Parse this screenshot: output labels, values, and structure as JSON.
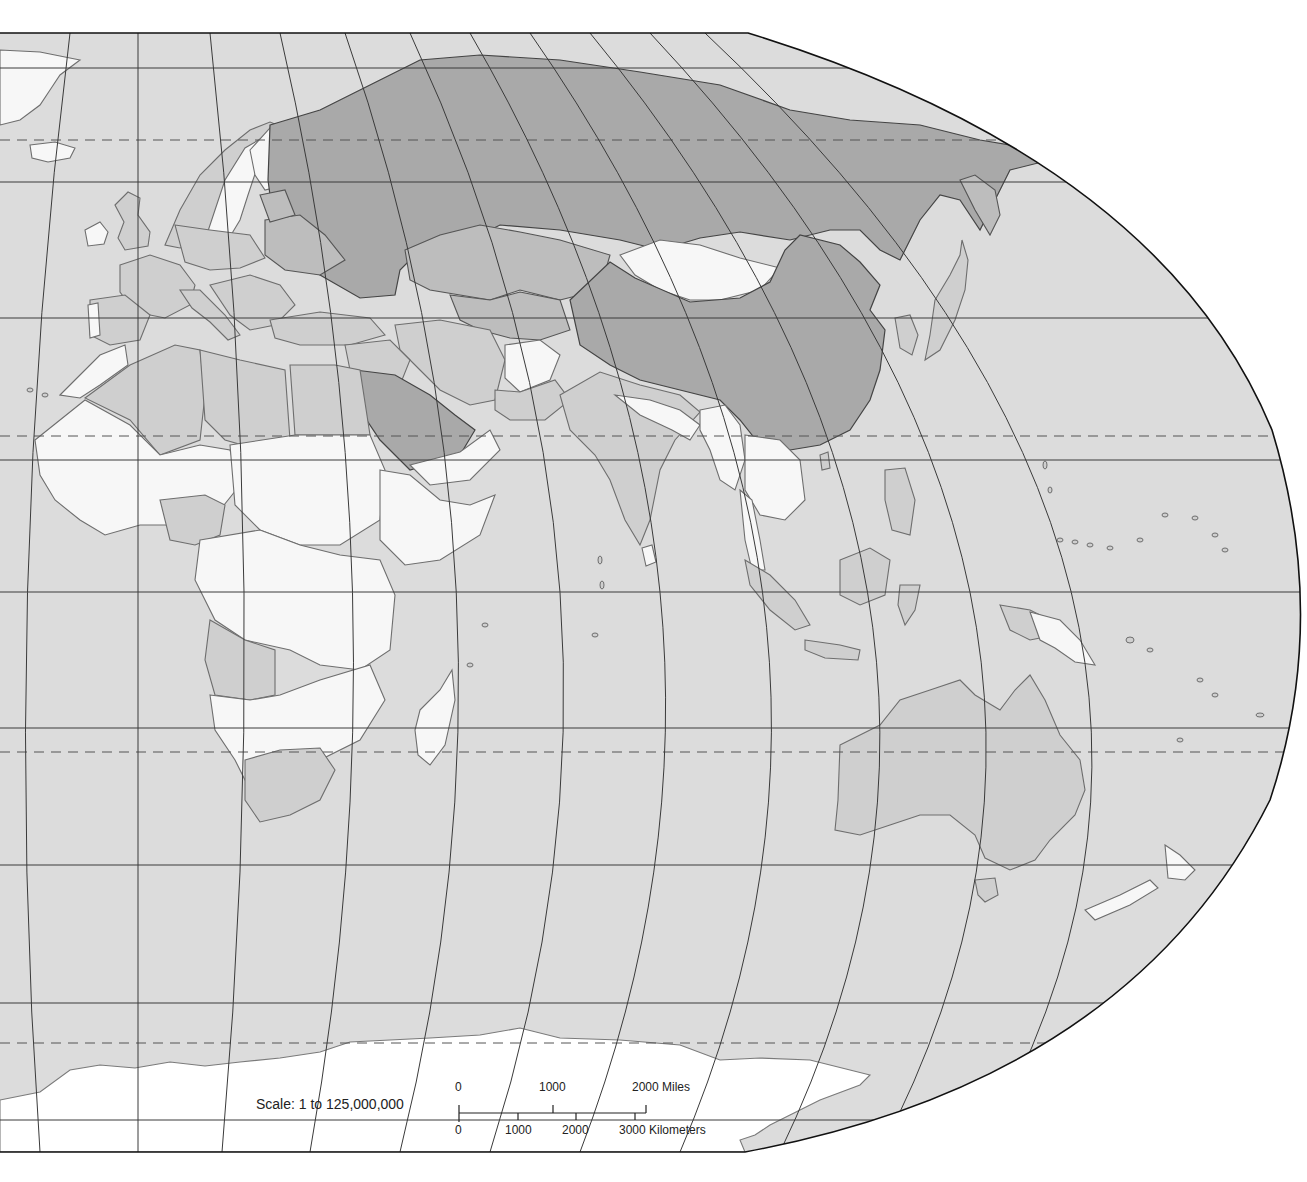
{
  "map": {
    "type": "world political outline map (Eastern Hemisphere)",
    "projection_style": "pseudocylindrical (Robinson-like), right half",
    "colors": {
      "ocean": "#dcdcdc",
      "land_white": "#f7f7f7",
      "land_light": "#cfcfcf",
      "land_mid": "#bdbdbd",
      "land_dark": "#a9a9a9",
      "graticule": "#3a3a3a",
      "frame": "#111111"
    },
    "regions_shown": [
      "Europe",
      "Africa",
      "Middle East",
      "Asia",
      "Southeast Asia",
      "Australia",
      "New Zealand",
      "Pacific Islands",
      "Antarctica"
    ]
  },
  "scale": {
    "title": "Scale:  1 to 125,000,000",
    "miles": {
      "ticks": [
        "0",
        "1000",
        "2000 Miles"
      ]
    },
    "kilometers": {
      "ticks": [
        "0",
        "1000",
        "2000",
        "3000 Kilometers"
      ]
    }
  }
}
